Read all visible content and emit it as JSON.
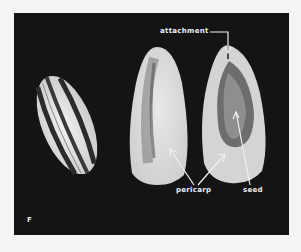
{
  "figure": {
    "panel_letter": "F",
    "labels": {
      "attachment": "attachment",
      "pericarp": "pericarp",
      "seed": "seed"
    },
    "subjects": [
      "whole striped sunflower achene",
      "achene with pericarp (outer view)",
      "achene cut open showing seed inside pericarp"
    ],
    "colors": {
      "background": "#141414",
      "page": "#f4f4f2",
      "label_text": "#f0f0f0"
    }
  }
}
